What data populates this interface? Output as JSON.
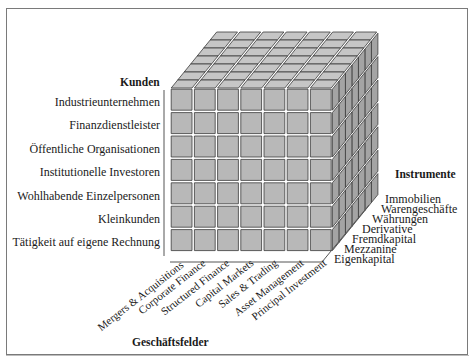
{
  "diagram": {
    "axes": {
      "kunden": {
        "title": "Kunden",
        "items": [
          "Industrieunternehmen",
          "Finanzdienstleister",
          "Öffentliche Organisationen",
          "Institutionelle Investoren",
          "Wohlhabende Einzelpersonen",
          "Kleinkunden",
          "Tätigkeit auf eigene Rechnung"
        ]
      },
      "instrumente": {
        "title": "Instrumente",
        "items": [
          "Immobilien",
          "Warengeschäfte",
          "Währungen",
          "Derivative",
          "Fremdkapital",
          "Mezzanine",
          "Eigenkapital"
        ]
      },
      "geschaeftsfelder": {
        "title": "Geschäftsfelder",
        "items": [
          "Mergers & Acquisitions",
          "Corporate Finance",
          "Structured Finance",
          "Capital Markets",
          "Sales & Trading",
          "Asset Management",
          "Principal Investment"
        ]
      }
    },
    "cube": {
      "columns": 7,
      "rows": 7,
      "depth": 7,
      "colors": {
        "front": "#b8b8b8",
        "top": "#c6c6c6",
        "side": "#a4a4a4",
        "edge": "#3a3a3a"
      }
    }
  }
}
